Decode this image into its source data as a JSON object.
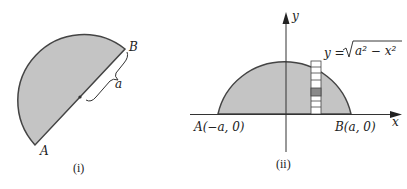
{
  "figure_i": {
    "caption": "(i)",
    "label_a_end": "A",
    "label_b_end": "B",
    "radius_label": "a"
  },
  "figure_ii": {
    "caption": "(ii)",
    "x_axis_label": "x",
    "y_axis_label": "y",
    "point_a_label": "A(−a, 0)",
    "point_b_label": "B(a, 0)",
    "curve_label_lhs": "y = ",
    "curve_label_rad": "a² − x²"
  },
  "colors": {
    "fill": "#c4c4c4",
    "stroke": "#444444",
    "highlight_cell": "#8a8a8a",
    "strip_cell": "#ffffff"
  }
}
